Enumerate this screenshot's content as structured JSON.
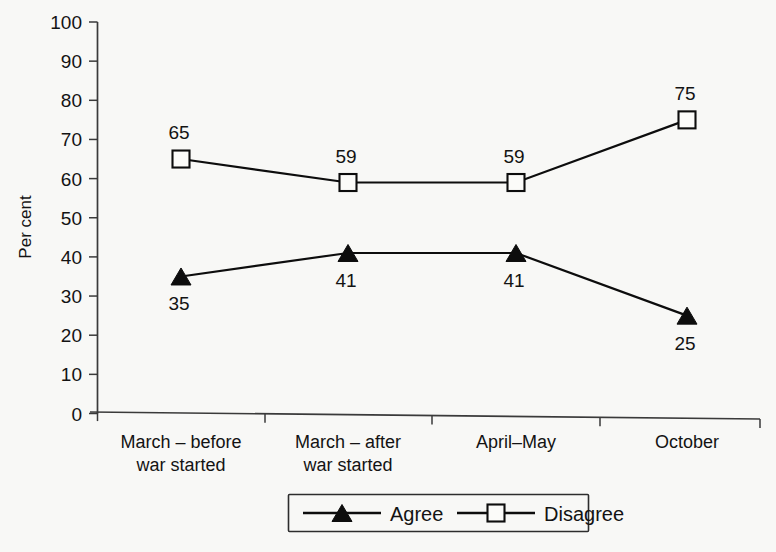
{
  "chart_data": {
    "type": "line",
    "title": "",
    "xlabel": "",
    "ylabel": "Per cent",
    "ylim": [
      0,
      100
    ],
    "yticks": [
      0,
      10,
      20,
      30,
      40,
      50,
      60,
      70,
      80,
      90,
      100
    ],
    "ytick_labels": [
      "0",
      "10",
      "20",
      "30",
      "40",
      "50",
      "60",
      "70",
      "80",
      "90",
      "100"
    ],
    "grid": false,
    "legend_position": "bottom-center",
    "categories": [
      "March – before\nwar started",
      "March – after\nwar started",
      "April–May",
      "October"
    ],
    "category_lines": [
      [
        "March – before",
        "war started"
      ],
      [
        "March – after",
        "war started"
      ],
      [
        "April–May",
        ""
      ],
      [
        "October",
        ""
      ]
    ],
    "series": [
      {
        "name": "Agree",
        "marker": "filled-triangle",
        "label_position": "below",
        "values": [
          35,
          41,
          41,
          25
        ],
        "value_labels": [
          "35",
          "41",
          "41",
          "25"
        ]
      },
      {
        "name": "Disagree",
        "marker": "open-square",
        "label_position": "above",
        "values": [
          65,
          59,
          59,
          75
        ],
        "value_labels": [
          "65",
          "59",
          "59",
          "75"
        ]
      }
    ],
    "colors": {
      "background": "#f8f8f6",
      "ink": "#0d0d0d",
      "axis": "#3a3a3a",
      "marker_fill_open": "#fbfbf9"
    }
  },
  "legend": {
    "items": [
      {
        "label": "Agree",
        "marker": "filled-triangle"
      },
      {
        "label": "Disagree",
        "marker": "open-square"
      }
    ]
  },
  "axis": {
    "y_title": "Per cent"
  }
}
